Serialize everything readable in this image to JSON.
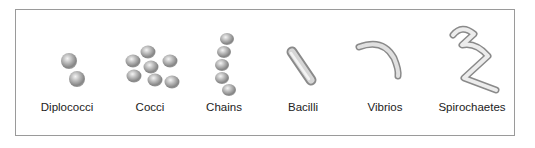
{
  "diagram": {
    "items": [
      {
        "label": "Diplococci",
        "x": 67
      },
      {
        "label": "Cocci",
        "x": 150
      },
      {
        "label": "Chains",
        "x": 224
      },
      {
        "label": "Bacilli",
        "x": 303
      },
      {
        "label": "Vibrios",
        "x": 385
      },
      {
        "label": "Spirochaetes",
        "x": 472
      }
    ]
  }
}
